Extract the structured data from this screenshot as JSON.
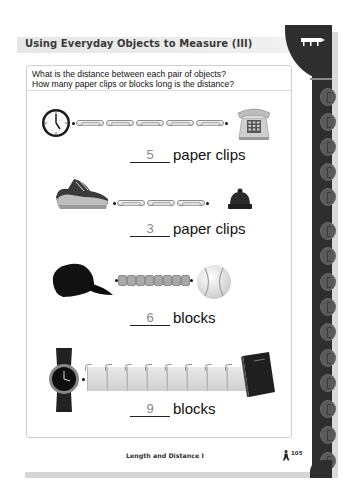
{
  "header": {
    "title": "Using Everyday Objects to Measure (III)",
    "tab_icon": "ruler-icon"
  },
  "instructions": {
    "line1": "What is the distance between each pair of objects?",
    "line2": "How many paper clips or blocks long is the distance?"
  },
  "problems": [
    {
      "left_object": "clock-icon",
      "right_object": "telephone-icon",
      "unit_object": "paper-clip",
      "unit_count": 5,
      "answer": "5",
      "unit_label": "paper clips"
    },
    {
      "left_object": "sneaker-icon",
      "right_object": "winter-hat-icon",
      "unit_object": "paper-clip",
      "unit_count": 3,
      "answer": "3",
      "unit_label": "paper clips"
    },
    {
      "left_object": "baseball-cap-icon",
      "right_object": "baseball-icon",
      "unit_object": "small-block",
      "unit_count": 6,
      "answer": "6",
      "unit_label": "blocks"
    },
    {
      "left_object": "wristwatch-icon",
      "right_object": "book-icon",
      "unit_object": "large-block",
      "unit_count": 9,
      "answer": "9",
      "unit_label": "blocks"
    }
  ],
  "footer": {
    "section_title": "Length and Distance I",
    "page_number": "105",
    "mascot_icon": "running-kid-icon"
  },
  "colors": {
    "tab_dark": "#2e2e2e",
    "title_bar": "#e6e6e6",
    "answer_text": "#888888"
  }
}
